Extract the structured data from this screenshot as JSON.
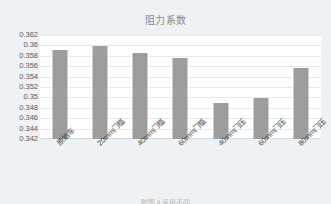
{
  "chart_data": {
    "type": "bar",
    "title": "阻力系数",
    "xlabel": "",
    "ylabel": "",
    "categories": [
      "原始车",
      "20mm门槛",
      "40mm门槛",
      "60mm门槛",
      "40mm门压",
      "60mm门压",
      "80mm门压"
    ],
    "values": [
      0.3592,
      0.3598,
      0.3585,
      0.3575,
      0.349,
      0.3498,
      0.3557
    ],
    "ylim": [
      0.342,
      0.362
    ],
    "ytick_step": 0.002,
    "ytick_labels": [
      "0.362",
      "0.36",
      "0.358",
      "0.356",
      "0.354",
      "0.352",
      "0.35",
      "0.348",
      "0.346",
      "0.344",
      "0.342"
    ],
    "ytick_values": [
      0.362,
      0.36,
      0.358,
      0.356,
      0.354,
      0.352,
      0.35,
      0.348,
      0.346,
      0.344,
      0.342
    ],
    "grid": true,
    "legend": false,
    "legend_position": "none",
    "bar_color": "#9d9d9d",
    "plot_background": "#ffffff",
    "figure_background": "#eef2f5",
    "title_color": "#8a8a8a"
  },
  "caption": {
    "bottom_text": "附图 4 采用不同"
  }
}
